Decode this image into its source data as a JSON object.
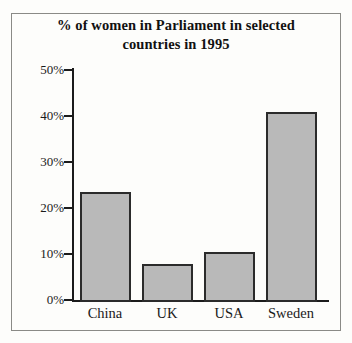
{
  "chart_data": {
    "type": "bar",
    "title": "% of women in Parliament in selected countries in 1995",
    "title_lines": [
      "% of women in Parliament in selected",
      "countries in 1995"
    ],
    "xlabel": "",
    "ylabel": "",
    "categories": [
      "China",
      "UK",
      "USA",
      "Sweden"
    ],
    "values": [
      23.5,
      7.8,
      10.5,
      40.8
    ],
    "value_labels": [
      "23.5%",
      "7.8%",
      "10.5%",
      "40.8%"
    ],
    "ylim": [
      0,
      50
    ],
    "ytick_values": [
      0,
      10,
      20,
      30,
      40,
      50
    ],
    "ytick_labels": [
      "0%",
      "10%",
      "20%",
      "30%",
      "40%",
      "50%"
    ],
    "grid": false,
    "legend": false,
    "legend_position": "none",
    "bar_fill_color": "#b9b9b9",
    "bar_edge_color": "#2b2b2b",
    "axis_color": "#1b1b1b",
    "background_color": "#fdfdfb"
  }
}
